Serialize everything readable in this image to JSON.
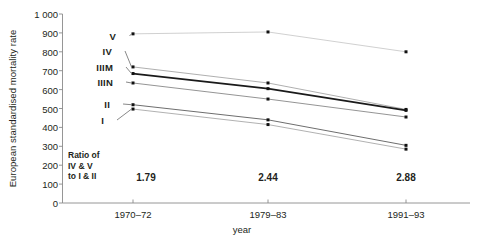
{
  "chart_data": {
    "type": "line",
    "title": "",
    "xlabel": "year",
    "ylabel": "European standardised mortality rate",
    "categories": [
      "1970–72",
      "1979–83",
      "1991–93"
    ],
    "ylim": [
      0,
      1000
    ],
    "ytick_labels": [
      "0",
      "100",
      "200",
      "300",
      "400",
      "500",
      "600",
      "700",
      "800",
      "900",
      "1 000"
    ],
    "ytick_values": [
      0,
      100,
      200,
      300,
      400,
      500,
      600,
      700,
      800,
      900,
      1000
    ],
    "grid": false,
    "legend_position": "inline-left-of-first-point",
    "series": [
      {
        "name": "V",
        "label": "V",
        "values": [
          895,
          905,
          800
        ],
        "color": "#bbbbbb",
        "width": 0.7,
        "marker": true
      },
      {
        "name": "IV",
        "label": "IV",
        "values": [
          720,
          635,
          495
        ],
        "color": "#9a9a9a",
        "width": 0.8,
        "marker": true
      },
      {
        "name": "IIIM",
        "label": "IIIM",
        "values": [
          685,
          605,
          490
        ],
        "color": "#1a1a1a",
        "width": 1.8,
        "marker": true
      },
      {
        "name": "IIIN",
        "label": "IIIN",
        "values": [
          635,
          550,
          455
        ],
        "color": "#888888",
        "width": 0.9,
        "marker": true
      },
      {
        "name": "II",
        "label": "II",
        "values": [
          520,
          440,
          305
        ],
        "color": "#6e6e6e",
        "width": 1.0,
        "marker": true
      },
      {
        "name": "I",
        "label": "I",
        "values": [
          497,
          415,
          285
        ],
        "color": "#a8a8a8",
        "width": 0.9,
        "marker": true
      }
    ],
    "annotations": {
      "ratio_caption_lines": [
        "Ratio of",
        "IV & V",
        "to I & II"
      ],
      "ratio_values": [
        "1.79",
        "2.44",
        "2.88"
      ]
    }
  }
}
